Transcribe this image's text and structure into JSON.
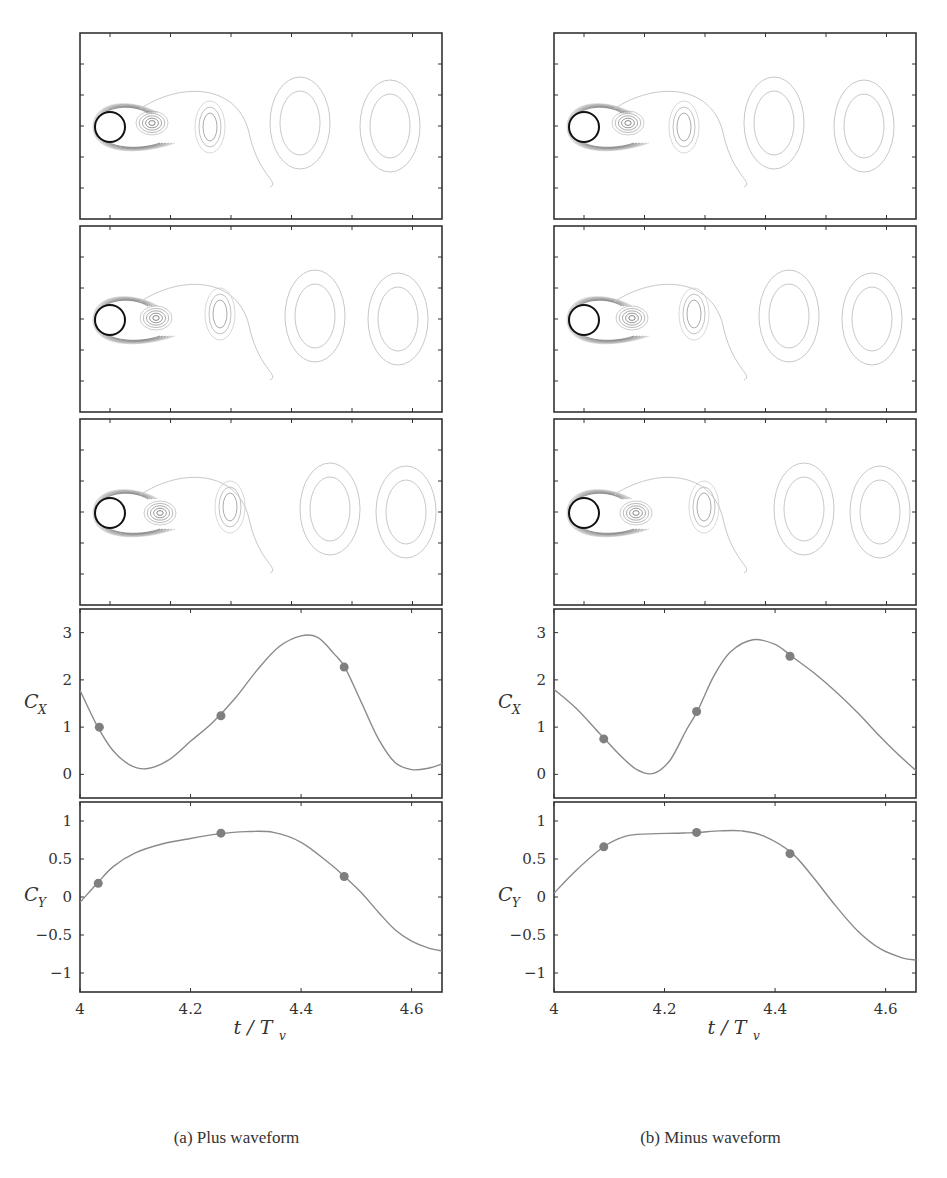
{
  "figure": {
    "subfigures": [
      {
        "id": "a",
        "caption": "(a) Plus waveform",
        "vorticity_snapshots": 3,
        "cx_label": "C",
        "cx_sub": "X",
        "cy_label": "C",
        "cy_sub": "Y",
        "xlabel": "t / T",
        "xlabel_sub": "v"
      },
      {
        "id": "b",
        "caption": "(b) Minus waveform",
        "vorticity_snapshots": 3,
        "cx_label": "C",
        "cx_sub": "X",
        "cy_label": "C",
        "cy_sub": "Y",
        "xlabel": "t / T",
        "xlabel_sub": "v"
      }
    ],
    "colors": {
      "curve": "#8a8a8a",
      "marker": "#7f7f7f",
      "frame": "#333333",
      "contour_dark": "#333333",
      "contour_light": "#c8c8c8"
    }
  },
  "chart_data": [
    {
      "panel": "(a) Plus waveform - C_X",
      "type": "line",
      "xlabel": "t/T_v",
      "ylabel": "C_X",
      "xlim": [
        4,
        4.655
      ],
      "ylim": [
        -0.5,
        3.5
      ],
      "xticks": [
        4,
        4.2,
        4.4,
        4.6
      ],
      "yticks": [
        0,
        1,
        2,
        3
      ],
      "grid": false,
      "x": [
        4.0,
        4.03,
        4.06,
        4.09,
        4.12,
        4.16,
        4.2,
        4.24,
        4.28,
        4.32,
        4.36,
        4.4,
        4.43,
        4.46,
        4.48,
        4.51,
        4.54,
        4.57,
        4.6,
        4.63,
        4.655
      ],
      "values": [
        1.78,
        1.05,
        0.5,
        0.2,
        0.12,
        0.3,
        0.7,
        1.1,
        1.6,
        2.2,
        2.7,
        2.93,
        2.9,
        2.55,
        2.25,
        1.5,
        0.75,
        0.25,
        0.1,
        0.13,
        0.22
      ],
      "markers": {
        "x": [
          4.035,
          4.255,
          4.478
        ],
        "y": [
          1.0,
          1.24,
          2.27
        ]
      }
    },
    {
      "panel": "(a) Plus waveform - C_Y",
      "type": "line",
      "xlabel": "t/T_v",
      "ylabel": "C_Y",
      "xlim": [
        4,
        4.655
      ],
      "ylim": [
        -1.25,
        1.25
      ],
      "xticks": [
        4,
        4.2,
        4.4,
        4.6
      ],
      "yticks": [
        -1,
        -0.5,
        0,
        0.5,
        1
      ],
      "grid": false,
      "x": [
        4.0,
        4.03,
        4.06,
        4.1,
        4.15,
        4.2,
        4.25,
        4.3,
        4.35,
        4.4,
        4.45,
        4.48,
        4.51,
        4.54,
        4.57,
        4.6,
        4.63,
        4.655
      ],
      "values": [
        -0.07,
        0.17,
        0.4,
        0.58,
        0.7,
        0.77,
        0.83,
        0.86,
        0.85,
        0.72,
        0.45,
        0.26,
        0.05,
        -0.2,
        -0.43,
        -0.58,
        -0.67,
        -0.71
      ],
      "markers": {
        "x": [
          4.033,
          4.255,
          4.478
        ],
        "y": [
          0.18,
          0.84,
          0.27
        ]
      }
    },
    {
      "panel": "(b) Minus waveform - C_X",
      "type": "line",
      "xlabel": "t/T_v",
      "ylabel": "C_X",
      "xlim": [
        4,
        4.655
      ],
      "ylim": [
        -0.5,
        3.5
      ],
      "xticks": [
        4,
        4.2,
        4.4,
        4.6
      ],
      "yticks": [
        0,
        1,
        2,
        3
      ],
      "grid": false,
      "x": [
        4.0,
        4.04,
        4.08,
        4.12,
        4.15,
        4.18,
        4.21,
        4.24,
        4.26,
        4.29,
        4.32,
        4.36,
        4.4,
        4.43,
        4.47,
        4.51,
        4.55,
        4.59,
        4.62,
        4.655
      ],
      "values": [
        1.8,
        1.4,
        0.9,
        0.4,
        0.1,
        0.02,
        0.3,
        0.95,
        1.35,
        2.1,
        2.6,
        2.85,
        2.75,
        2.5,
        2.15,
        1.75,
        1.3,
        0.8,
        0.45,
        0.08
      ],
      "markers": {
        "x": [
          4.09,
          4.258,
          4.427
        ],
        "y": [
          0.75,
          1.33,
          2.5
        ]
      }
    },
    {
      "panel": "(b) Minus waveform - C_Y",
      "type": "line",
      "xlabel": "t/T_v",
      "ylabel": "C_Y",
      "xlim": [
        4,
        4.655
      ],
      "ylim": [
        -1.25,
        1.25
      ],
      "xticks": [
        4,
        4.2,
        4.4,
        4.6
      ],
      "yticks": [
        -1,
        -0.5,
        0,
        0.5,
        1
      ],
      "grid": false,
      "x": [
        4.0,
        4.04,
        4.09,
        4.13,
        4.17,
        4.22,
        4.26,
        4.3,
        4.34,
        4.38,
        4.43,
        4.47,
        4.51,
        4.55,
        4.59,
        4.63,
        4.655
      ],
      "values": [
        0.05,
        0.35,
        0.66,
        0.8,
        0.83,
        0.84,
        0.85,
        0.87,
        0.87,
        0.8,
        0.58,
        0.25,
        -0.12,
        -0.45,
        -0.68,
        -0.8,
        -0.83
      ],
      "markers": {
        "x": [
          4.09,
          4.258,
          4.427
        ],
        "y": [
          0.66,
          0.85,
          0.57
        ]
      }
    }
  ]
}
